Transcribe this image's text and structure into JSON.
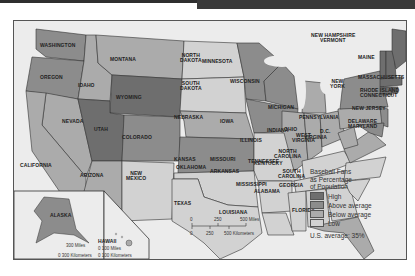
{
  "title_bar": {
    "left_color": "#2f2f2f",
    "right_color": "#3a3a3a"
  },
  "map": {
    "type": "choropleth",
    "subject": "Baseball Fans as Percentage of Population",
    "states": [
      {
        "name": "WASHINGTON",
        "level": "above_average"
      },
      {
        "name": "OREGON",
        "level": "above_average"
      },
      {
        "name": "IDAHO",
        "level": "below_average"
      },
      {
        "name": "MONTANA",
        "level": "below_average"
      },
      {
        "name": "WYOMING",
        "level": "high"
      },
      {
        "name": "NORTH DAKOTA",
        "level": "low"
      },
      {
        "name": "SOUTH DAKOTA",
        "level": "low"
      },
      {
        "name": "MINNESOTA",
        "level": "above_average"
      },
      {
        "name": "WISCONSIN",
        "level": "above_average"
      },
      {
        "name": "MICHIGAN",
        "level": "below_average"
      },
      {
        "name": "NEBRASKA",
        "level": "below_average"
      },
      {
        "name": "IOWA",
        "level": "above_average"
      },
      {
        "name": "ILLINOIS",
        "level": "below_average"
      },
      {
        "name": "INDIANA",
        "level": "below_average"
      },
      {
        "name": "OHIO",
        "level": "below_average"
      },
      {
        "name": "NEVADA",
        "level": "below_average"
      },
      {
        "name": "UTAH",
        "level": "high"
      },
      {
        "name": "COLORADO",
        "level": "above_average"
      },
      {
        "name": "KANSAS",
        "level": "above_average"
      },
      {
        "name": "MISSOURI",
        "level": "low"
      },
      {
        "name": "KENTUCKY",
        "level": "low"
      },
      {
        "name": "CALIFORNIA",
        "level": "below_average"
      },
      {
        "name": "ARIZONA",
        "level": "below_average"
      },
      {
        "name": "NEW MEXICO",
        "level": "low"
      },
      {
        "name": "OKLAHOMA",
        "level": "low"
      },
      {
        "name": "ARKANSAS",
        "level": "low"
      },
      {
        "name": "TENNESSEE",
        "level": "low"
      },
      {
        "name": "TEXAS",
        "level": "low"
      },
      {
        "name": "LOUISIANA",
        "level": "low"
      },
      {
        "name": "MISSISSIPPI",
        "level": "low"
      },
      {
        "name": "ALABAMA",
        "level": "low"
      },
      {
        "name": "GEORGIA",
        "level": "low"
      },
      {
        "name": "FLORIDA",
        "level": "below_average"
      },
      {
        "name": "SOUTH CAROLINA",
        "level": "low"
      },
      {
        "name": "NORTH CAROLINA",
        "level": "low"
      },
      {
        "name": "VIRGINIA",
        "level": "below_average"
      },
      {
        "name": "WEST VIRGINIA",
        "level": "below_average"
      },
      {
        "name": "PENNSYLVANIA",
        "level": "below_average"
      },
      {
        "name": "NEW YORK",
        "level": "above_average"
      },
      {
        "name": "NEW JERSEY",
        "level": "above_average"
      },
      {
        "name": "DELAWARE",
        "level": "above_average"
      },
      {
        "name": "MARYLAND",
        "level": "above_average"
      },
      {
        "name": "D.C.",
        "level": "above_average"
      },
      {
        "name": "MAINE",
        "level": "high"
      },
      {
        "name": "NEW HAMPSHIRE",
        "level": "high"
      },
      {
        "name": "VERMONT",
        "level": "high"
      },
      {
        "name": "MASSACHUSETTS",
        "level": "high"
      },
      {
        "name": "RHODE ISLAND",
        "level": "high"
      },
      {
        "name": "CONNECTICUT",
        "level": "high"
      },
      {
        "name": "ALASKA",
        "level": "above_average"
      },
      {
        "name": "HAWAII",
        "level": "below_average"
      }
    ],
    "labels": {
      "washington": "WASHINGTON",
      "oregon": "OREGON",
      "idaho": "IDAHO",
      "montana": "MONTANA",
      "wyoming": "WYOMING",
      "north_dakota_1": "NORTH",
      "north_dakota_2": "DAKOTA",
      "south_dakota_1": "SOUTH",
      "south_dakota_2": "DAKOTA",
      "minnesota": "MINNESOTA",
      "wisconsin": "WISCONSIN",
      "michigan": "MICHIGAN",
      "nebraska": "NEBRASKA",
      "iowa": "IOWA",
      "illinois": "ILLINOIS",
      "indiana": "INDIANA",
      "ohio": "OHIO",
      "nevada": "NEVADA",
      "utah": "UTAH",
      "colorado": "COLORADO",
      "kansas": "KANSAS",
      "missouri": "MISSOURI",
      "kentucky": "KENTUCKY",
      "california": "CALIFORNIA",
      "arizona": "ARIZONA",
      "new_mexico_1": "NEW",
      "new_mexico_2": "MEXICO",
      "oklahoma": "OKLAHOMA",
      "arkansas": "ARKANSAS",
      "tennessee": "TENNESSEE",
      "texas": "TEXAS",
      "louisiana": "LOUISIANA",
      "mississippi": "MISSISSIPPI",
      "alabama": "ALABAMA",
      "georgia": "GEORGIA",
      "florida": "FLORIDA",
      "south_carolina_1": "SOUTH",
      "south_carolina_2": "CAROLINA",
      "north_carolina_1": "NORTH",
      "north_carolina_2": "CAROLINA",
      "virginia": "VIRGINIA",
      "west_virginia_1": "WEST",
      "west_virginia_2": "VIRGINIA",
      "pennsylvania": "PENNSYLVANIA",
      "new_york_1": "NEW",
      "new_york_2": "YORK",
      "new_jersey": "NEW JERSEY",
      "delaware": "DELAWARE",
      "maryland": "MARYLAND",
      "dc": "D.C.",
      "maine": "MAINE",
      "new_hampshire": "NEW HAMPSHIRE",
      "vermont": "VERMONT",
      "massachusetts": "MASSACHUSETTS",
      "rhode_island": "RHODE ISLAND",
      "connecticut": "CONNECTICUT",
      "alaska": "ALASKA",
      "hawaii": "HAWAII"
    },
    "colors": {
      "high": "#6e6e6e",
      "above_average": "#8c8c8c",
      "below_average": "#ababab",
      "low": "#d2d2d2",
      "water": "#ececec"
    }
  },
  "legend": {
    "title_line1": "Baseball Fans",
    "title_line2": "as Percentage",
    "title_line3": "of Population",
    "items": [
      {
        "label": "High",
        "color": "#6e6e6e"
      },
      {
        "label": "Above average",
        "color": "#8c8c8c"
      },
      {
        "label": "Below average",
        "color": "#ababab"
      },
      {
        "label": "Low",
        "color": "#d2d2d2"
      }
    ],
    "average_text": "U.S. average:  35%"
  },
  "scale_bar": {
    "miles": [
      "0",
      "250",
      "500 Miles"
    ],
    "kilometers": [
      "0",
      "250",
      "500 Kilometers"
    ]
  },
  "alaska_inset": {
    "miles": "300 Miles",
    "km": "0 300 Kilometers"
  },
  "hawaii_inset": {
    "miles": "0   100 Miles",
    "km": "0  100 Kilometers"
  }
}
